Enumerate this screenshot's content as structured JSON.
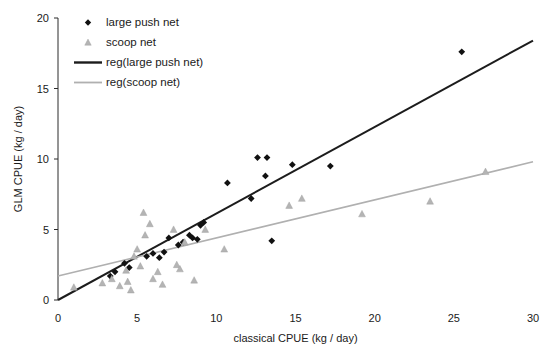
{
  "chart_data": {
    "type": "scatter",
    "title": "",
    "xlabel": "classical CPUE (kg / day)",
    "ylabel": "GLM CPUE (kg / day)",
    "xlim": [
      0,
      30
    ],
    "ylim": [
      0,
      20
    ],
    "xticks": [
      0,
      5,
      10,
      15,
      20,
      25,
      30
    ],
    "yticks": [
      0,
      5,
      10,
      15,
      20
    ],
    "grid": false,
    "legend_position": "top-left",
    "legend": [
      {
        "label": "large push net",
        "marker": "diamond",
        "color": "#111111"
      },
      {
        "label": "scoop net",
        "marker": "triangle",
        "color": "#b4b4b4"
      },
      {
        "label": "reg(large push net)",
        "marker": "line",
        "color": "#1c1c1c"
      },
      {
        "label": "reg(scoop net)",
        "marker": "line",
        "color": "#b0b0b0"
      }
    ],
    "series": [
      {
        "name": "large push net",
        "marker": "diamond",
        "color": "#111111",
        "points": [
          [
            3.3,
            1.7
          ],
          [
            3.6,
            2.0
          ],
          [
            4.2,
            2.6
          ],
          [
            4.5,
            2.3
          ],
          [
            5.6,
            3.1
          ],
          [
            6.0,
            3.3
          ],
          [
            6.4,
            3.0
          ],
          [
            6.7,
            3.4
          ],
          [
            7.0,
            4.4
          ],
          [
            7.6,
            3.9
          ],
          [
            7.9,
            4.1
          ],
          [
            8.3,
            4.6
          ],
          [
            8.5,
            4.4
          ],
          [
            8.8,
            4.3
          ],
          [
            9.0,
            5.3
          ],
          [
            9.2,
            5.5
          ],
          [
            10.7,
            8.3
          ],
          [
            12.2,
            7.2
          ],
          [
            12.6,
            10.1
          ],
          [
            13.1,
            8.8
          ],
          [
            13.2,
            10.1
          ],
          [
            13.5,
            4.2
          ],
          [
            14.8,
            9.6
          ],
          [
            17.2,
            9.5
          ],
          [
            25.5,
            17.6
          ]
        ]
      },
      {
        "name": "scoop net",
        "marker": "triangle",
        "color": "#b4b4b4",
        "points": [
          [
            1.0,
            0.9
          ],
          [
            2.8,
            1.2
          ],
          [
            3.4,
            1.5
          ],
          [
            3.9,
            1.0
          ],
          [
            4.3,
            2.1
          ],
          [
            4.4,
            1.3
          ],
          [
            4.6,
            0.7
          ],
          [
            4.8,
            3.1
          ],
          [
            5.0,
            3.6
          ],
          [
            5.2,
            2.4
          ],
          [
            5.4,
            6.2
          ],
          [
            5.5,
            4.6
          ],
          [
            5.8,
            5.4
          ],
          [
            6.0,
            1.5
          ],
          [
            6.3,
            2.0
          ],
          [
            6.6,
            1.1
          ],
          [
            7.3,
            5.0
          ],
          [
            7.5,
            2.5
          ],
          [
            7.7,
            2.2
          ],
          [
            8.0,
            4.1
          ],
          [
            8.6,
            1.4
          ],
          [
            9.3,
            5.0
          ],
          [
            10.5,
            3.6
          ],
          [
            14.6,
            6.7
          ],
          [
            15.4,
            7.2
          ],
          [
            19.2,
            6.1
          ],
          [
            23.5,
            7.0
          ],
          [
            27.0,
            9.1
          ]
        ]
      }
    ],
    "regressions": [
      {
        "name": "reg(large push net)",
        "color": "#1c1c1c",
        "x_start": 0.0,
        "y_start": 0.0,
        "x_end": 30.0,
        "y_end": 18.4
      },
      {
        "name": "reg(scoop net)",
        "color": "#b0b0b0",
        "x_start": 0.0,
        "y_start": 1.7,
        "x_end": 30.0,
        "y_end": 9.8
      }
    ]
  }
}
